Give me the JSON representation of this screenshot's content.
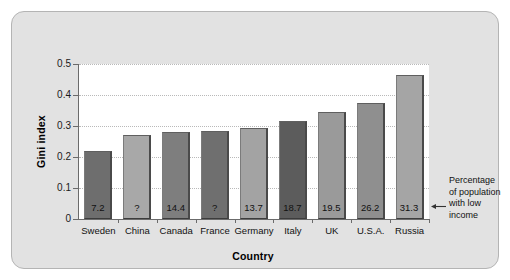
{
  "chart_data": {
    "type": "bar",
    "title": "",
    "xlabel": "Country",
    "ylabel": "Gini index",
    "categories": [
      "Sweden",
      "China",
      "Canada",
      "France",
      "Germany",
      "Italy",
      "UK",
      "U.S.A.",
      "Russia"
    ],
    "values": [
      0.22,
      0.27,
      0.28,
      0.285,
      0.295,
      0.315,
      0.345,
      0.375,
      0.465
    ],
    "bar_labels": [
      "7.2",
      "?",
      "14.4",
      "?",
      "13.7",
      "18.7",
      "19.5",
      "26.2",
      "31.3"
    ],
    "bar_label_meaning": "Percentage of population with low income",
    "bar_colors": [
      "#6e6e6e",
      "#a8a8a8",
      "#7e7e7e",
      "#6f6f6f",
      "#a3a3a3",
      "#5c5c5c",
      "#9a9a9a",
      "#8f8f8f",
      "#a5a5a5"
    ],
    "ylim": [
      0,
      0.5
    ],
    "yticks": [
      0,
      0.1,
      0.2,
      0.3,
      0.4,
      0.5
    ],
    "ytick_labels": [
      "0",
      "0.1",
      "0.2",
      "0.3",
      "0.4",
      "0.5"
    ],
    "grid": true,
    "grid_axis": "y",
    "legend": "none"
  },
  "annotation": {
    "text": "Percentage of population with low income",
    "arrow": "left-arrow"
  },
  "colors": {
    "panel_background": "#e2e2e2",
    "panel_border": "#b4b4b4",
    "plot_background": "#ffffff",
    "axis": "#6b6b6b",
    "gridline": "#b9b9b9",
    "text": "#111111"
  }
}
